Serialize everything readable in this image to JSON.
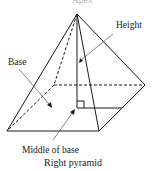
{
  "diagram": {
    "title": "Right pyramid",
    "apex_label": "Apex",
    "labels": {
      "height": "Height",
      "base": "Base",
      "middle_of_base": "Middle of base"
    },
    "line_color": "#1a1a1a",
    "leader_color": "#555555"
  }
}
